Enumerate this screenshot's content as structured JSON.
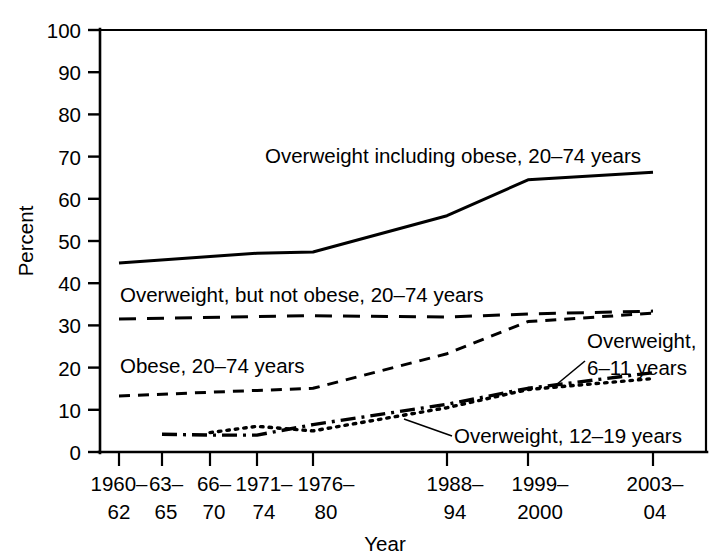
{
  "chart_data": {
    "type": "line",
    "title": "",
    "xlabel": "Year",
    "ylabel": "Percent",
    "ylim": [
      0,
      100
    ],
    "ytick_values": [
      0,
      10,
      20,
      30,
      40,
      50,
      60,
      70,
      80,
      90,
      100
    ],
    "ytick_labels": [
      "0",
      "10",
      "20",
      "30",
      "40",
      "50",
      "60",
      "70",
      "80",
      "90",
      "100"
    ],
    "grid": false,
    "legend_position": "inline-annotations",
    "x_categories": [
      "1960–62",
      "63–65",
      "66–70",
      "1971–74",
      "1976–80",
      "1988–94",
      "1999–2000",
      "2003–04"
    ],
    "xtick_labels": [
      {
        "line1": "1960–",
        "line2": "62"
      },
      {
        "line1": "63–",
        "line2": "65"
      },
      {
        "line1": "66–",
        "line2": "70"
      },
      {
        "line1": "1971–",
        "line2": "74"
      },
      {
        "line1": "1976–",
        "line2": "80"
      },
      {
        "line1": "1988–",
        "line2": "94"
      },
      {
        "line1": "1999–",
        "line2": "2000"
      },
      {
        "line1": "2003–",
        "line2": "04"
      }
    ],
    "series": [
      {
        "name": "Overweight including obese, 20–74 years",
        "style": "solid",
        "x_indices": [
          0,
          3,
          4,
          5,
          6,
          7
        ],
        "values": [
          44.8,
          47.1,
          47.4,
          56.0,
          64.5,
          66.3
        ]
      },
      {
        "name": "Overweight, but not obese, 20–74 years",
        "style": "long-dash",
        "x_indices": [
          0,
          3,
          4,
          5,
          6,
          7
        ],
        "values": [
          31.5,
          32.1,
          32.3,
          32.0,
          32.7,
          33.4
        ]
      },
      {
        "name": "Obese, 20–74 years",
        "style": "dash",
        "x_indices": [
          0,
          3,
          4,
          5,
          6,
          7
        ],
        "values": [
          13.3,
          14.6,
          15.1,
          23.3,
          30.9,
          32.9
        ]
      },
      {
        "name": "Overweight, 6–11 years",
        "style": "dash-dot",
        "x_indices": [
          1,
          2,
          3,
          4,
          5,
          6,
          7
        ],
        "values": [
          4.2,
          4.0,
          4.0,
          6.5,
          11.3,
          15.1,
          18.8
        ]
      },
      {
        "name": "Overweight, 12–19 years",
        "style": "dot",
        "x_indices": [
          2,
          3,
          4,
          5,
          6,
          7
        ],
        "values": [
          4.6,
          6.1,
          5.0,
          10.5,
          14.8,
          17.4
        ]
      }
    ],
    "annotations": [
      {
        "id": "label-overweight-including-obese",
        "text": "Overweight including obese, 20–74 years"
      },
      {
        "id": "label-overweight-not-obese",
        "text": "Overweight, but not obese, 20–74 years"
      },
      {
        "id": "label-obese",
        "text": "Obese, 20–74 years"
      },
      {
        "id": "label-overweight-6-11-line1",
        "text": "Overweight,"
      },
      {
        "id": "label-overweight-6-11-line2",
        "text": "6–11 years"
      },
      {
        "id": "label-overweight-12-19",
        "text": "Overweight, 12–19 years"
      }
    ],
    "colors": {
      "ink": "#000000",
      "background": "#ffffff"
    }
  }
}
